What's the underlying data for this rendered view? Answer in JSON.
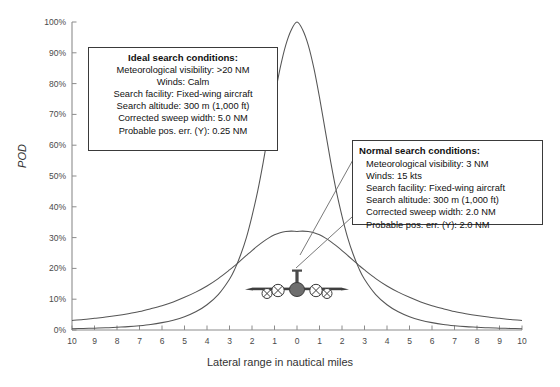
{
  "chart_data": {
    "type": "line",
    "title": "",
    "xlabel": "Lateral range in nautical miles",
    "ylabel": "POD",
    "xlim": [
      -10,
      10
    ],
    "ylim": [
      0,
      1.0
    ],
    "grid": false,
    "legend": "none",
    "x_tick_labels": [
      "10",
      "9",
      "8",
      "7",
      "6",
      "5",
      "4",
      "3",
      "2",
      "1",
      "0",
      "1",
      "2",
      "3",
      "4",
      "5",
      "6",
      "7",
      "8",
      "9",
      "10"
    ],
    "x_tick_values": [
      -10,
      -9,
      -8,
      -7,
      -6,
      -5,
      -4,
      -3,
      -2,
      -1,
      0,
      1,
      2,
      3,
      4,
      5,
      6,
      7,
      8,
      9,
      10
    ],
    "y_tick_labels": [
      "0%",
      "10%",
      "20%",
      "30%",
      "40%",
      "50%",
      "60%",
      "70%",
      "80%",
      "90%",
      "100%"
    ],
    "y_tick_values": [
      0,
      0.1,
      0.2,
      0.3,
      0.4,
      0.5,
      0.6,
      0.7,
      0.8,
      0.9,
      1.0
    ],
    "series": [
      {
        "name": "Ideal search conditions",
        "x": [
          -10,
          -9.5,
          -9,
          -8.5,
          -8,
          -7.5,
          -7,
          -6.5,
          -6,
          -5.5,
          -5,
          -4.5,
          -4,
          -3.5,
          -3,
          -2.75,
          -2.5,
          -2.25,
          -2,
          -1.75,
          -1.5,
          -1.25,
          -1,
          -0.75,
          -0.5,
          -0.25,
          0,
          0.25,
          0.5,
          0.75,
          1,
          1.25,
          1.5,
          1.75,
          2,
          2.25,
          2.5,
          2.75,
          3,
          3.5,
          4,
          4.5,
          5,
          5.5,
          6,
          6.5,
          7,
          7.5,
          8,
          8.5,
          9,
          9.5,
          10
        ],
        "y": [
          0.004,
          0.005,
          0.006,
          0.007,
          0.009,
          0.011,
          0.014,
          0.018,
          0.024,
          0.032,
          0.043,
          0.059,
          0.082,
          0.115,
          0.165,
          0.2,
          0.245,
          0.3,
          0.37,
          0.45,
          0.545,
          0.65,
          0.755,
          0.85,
          0.925,
          0.975,
          1.0,
          0.975,
          0.925,
          0.85,
          0.755,
          0.65,
          0.545,
          0.45,
          0.37,
          0.3,
          0.245,
          0.2,
          0.165,
          0.115,
          0.082,
          0.059,
          0.043,
          0.032,
          0.024,
          0.018,
          0.014,
          0.011,
          0.009,
          0.007,
          0.006,
          0.005,
          0.004
        ]
      },
      {
        "name": "Normal search conditions",
        "x": [
          -10,
          -9.5,
          -9,
          -8.5,
          -8,
          -7.5,
          -7,
          -6.5,
          -6,
          -5.5,
          -5,
          -4.5,
          -4,
          -3.5,
          -3,
          -2.75,
          -2.5,
          -2.25,
          -2,
          -1.75,
          -1.5,
          -1.25,
          -1,
          -0.75,
          -0.5,
          -0.25,
          0,
          0.25,
          0.5,
          0.75,
          1,
          1.25,
          1.5,
          1.75,
          2,
          2.25,
          2.5,
          2.75,
          3,
          3.5,
          4,
          4.5,
          5,
          5.5,
          6,
          6.5,
          7,
          7.5,
          8,
          8.5,
          9,
          9.5,
          10
        ],
        "y": [
          0.031,
          0.034,
          0.038,
          0.042,
          0.047,
          0.053,
          0.06,
          0.069,
          0.079,
          0.091,
          0.106,
          0.123,
          0.143,
          0.167,
          0.195,
          0.21,
          0.226,
          0.242,
          0.258,
          0.273,
          0.287,
          0.299,
          0.309,
          0.316,
          0.32,
          0.321,
          0.32,
          0.321,
          0.32,
          0.316,
          0.309,
          0.299,
          0.287,
          0.273,
          0.258,
          0.242,
          0.226,
          0.21,
          0.195,
          0.167,
          0.143,
          0.123,
          0.106,
          0.091,
          0.079,
          0.069,
          0.06,
          0.053,
          0.047,
          0.042,
          0.038,
          0.034,
          0.031
        ]
      }
    ],
    "annotations": [
      {
        "id": "ideal",
        "heading": "Ideal search conditions:",
        "lines": [
          "Meteorological visibility:  >20 NM",
          "Winds: Calm",
          "Search facility: Fixed-wing aircraft",
          "Search altitude: 300 m (1,000 ft)",
          "Corrected sweep width: 5.0 NM",
          "Probable pos. err. (Y): 0.25 NM"
        ]
      },
      {
        "id": "normal",
        "heading": "Normal search conditions:",
        "lines": [
          "Meteorological visibility:  3 NM",
          "Winds: 15 kts",
          "Search facility: Fixed-wing aircraft",
          "Search altitude: 300 m (1,000 ft)",
          "Corrected sweep width: 2.0 NM",
          "Probable pos. err. (Y): 2.0 NM"
        ]
      }
    ],
    "icon": "aircraft-front-view",
    "colors": {
      "curve": "#555555",
      "axis": "#8c8c8c",
      "text": "#333333",
      "box_border": "#3a3a3a",
      "aircraft": "#4a4a4a",
      "background": "#ffffff"
    }
  }
}
